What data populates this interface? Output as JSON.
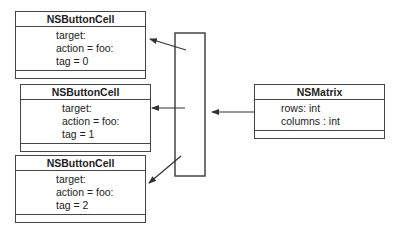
{
  "classes": [
    {
      "name": "NSButtonCell",
      "attributes": [
        "target:",
        "action = foo:",
        "tag = 0"
      ]
    },
    {
      "name": "NSButtonCell",
      "attributes": [
        "target:",
        "action = foo:",
        "tag = 1"
      ]
    },
    {
      "name": "NSButtonCell",
      "attributes": [
        "target:",
        "action = foo:",
        "tag = 2"
      ]
    }
  ],
  "matrix": {
    "name": "NSMatrix",
    "attributes": [
      "rows: int",
      "columns : int"
    ]
  },
  "colors": {
    "line": "#444444",
    "background": "#ffffff"
  }
}
